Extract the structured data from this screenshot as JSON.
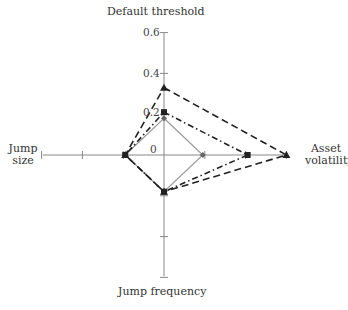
{
  "chart_data": {
    "type": "radar",
    "title": "",
    "axes": [
      "Default threshold",
      "Asset volatility",
      "Jump frequency",
      "Jump size"
    ],
    "axis_labels": {
      "top": "Default threshold",
      "right": "Asset volatility",
      "bottom": "Jump frequency",
      "left_line1": "Jump",
      "left_line2": "size",
      "right_line1": "Asset",
      "right_line2": "volatility"
    },
    "tick_labels": [
      "0",
      "0.2",
      "0.4",
      "0.6"
    ],
    "range": [
      0,
      0.6
    ],
    "series": [
      {
        "name": "baseline",
        "style": "solid",
        "marker": "diamond",
        "color": "#9a9a9a",
        "values": {
          "Default threshold": 0.18,
          "Asset volatility": 0.19,
          "Jump frequency": 0.18,
          "Jump size": 0.19
        }
      },
      {
        "name": "series 2",
        "style": "dash-dot",
        "marker": "square",
        "color": "#222222",
        "values": {
          "Default threshold": 0.21,
          "Asset volatility": 0.41,
          "Jump frequency": 0.18,
          "Jump size": 0.19
        }
      },
      {
        "name": "series 3",
        "style": "dashed",
        "marker": "triangle",
        "color": "#222222",
        "values": {
          "Default threshold": 0.33,
          "Asset volatility": 0.6,
          "Jump frequency": 0.18,
          "Jump size": 0.19
        }
      }
    ],
    "grid": false,
    "legend": "none"
  }
}
